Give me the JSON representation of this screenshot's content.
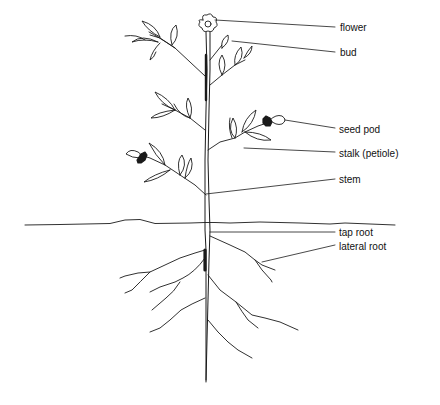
{
  "diagram": {
    "labels": [
      {
        "id": "flower",
        "text": "flower",
        "x": 340,
        "y": 22
      },
      {
        "id": "bud",
        "text": "bud",
        "x": 340,
        "y": 47
      },
      {
        "id": "seed-pod",
        "text": "seed pod",
        "x": 339,
        "y": 124
      },
      {
        "id": "stalk",
        "text": "stalk (petiole)",
        "x": 339,
        "y": 148
      },
      {
        "id": "stem",
        "text": "stem",
        "x": 339,
        "y": 174
      },
      {
        "id": "tap-root",
        "text": "tap root",
        "x": 339,
        "y": 227
      },
      {
        "id": "lateral-root",
        "text": "lateral root",
        "x": 339,
        "y": 241
      }
    ],
    "colors": {
      "line": "#1a1a1a",
      "background": "#ffffff"
    }
  }
}
